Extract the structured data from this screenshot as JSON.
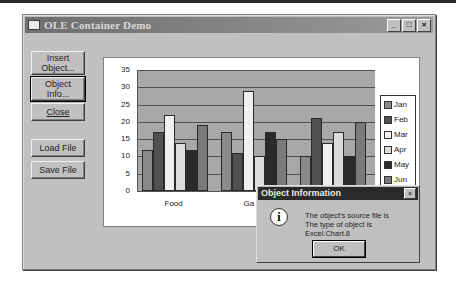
{
  "window": {
    "title": "OLE Container Demo",
    "controls": {
      "minimize": "_",
      "maximize": "□",
      "close": "×"
    }
  },
  "buttons": {
    "insert_object": {
      "line1": "Insert",
      "line2": "Object..."
    },
    "object_info": {
      "line1": "Object",
      "line2": "Info..."
    },
    "close": "Close",
    "load_file": "Load File",
    "save_file": "Save File"
  },
  "dialog": {
    "title": "Object Information",
    "icon": "info-icon",
    "line1": "The object's source file is",
    "line2": "The type of object is Excel.Chart.8",
    "ok": "OK"
  },
  "chart_data": {
    "type": "bar",
    "categories": [
      "Food",
      "Gas",
      ""
    ],
    "visible_category_labels": [
      "Food",
      "Ga"
    ],
    "series": [
      {
        "name": "Jan",
        "color": "#8a8a8a",
        "values": [
          12,
          17,
          10
        ]
      },
      {
        "name": "Feb",
        "color": "#505050",
        "values": [
          17,
          11,
          21
        ]
      },
      {
        "name": "Mar",
        "color": "#f0f0f0",
        "values": [
          22,
          29,
          14
        ]
      },
      {
        "name": "Apr",
        "color": "#dcdcdc",
        "values": [
          14,
          10,
          17
        ]
      },
      {
        "name": "May",
        "color": "#2a2a2a",
        "values": [
          12,
          17,
          10
        ]
      },
      {
        "name": "Jun",
        "color": "#7a7a7a",
        "values": [
          19,
          15,
          20
        ]
      }
    ],
    "yticks": [
      "35",
      "30",
      "25",
      "20",
      "15",
      "10",
      "5",
      "0"
    ],
    "ylim": [
      0,
      35
    ],
    "grid": true,
    "legend_position": "right",
    "title": "",
    "xlabel": "",
    "ylabel": ""
  }
}
